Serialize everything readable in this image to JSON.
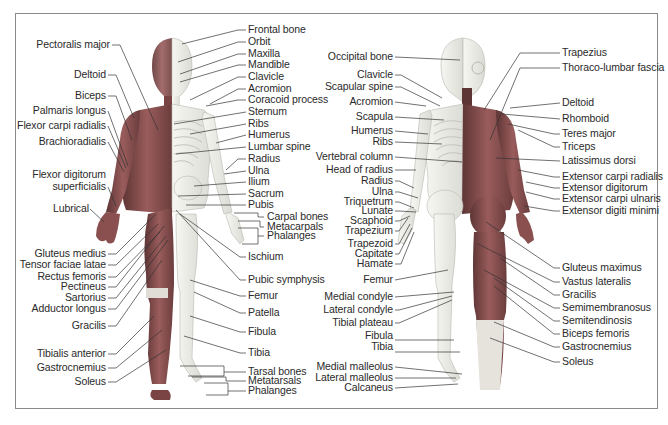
{
  "diagram": {
    "colors": {
      "muscle": "#8a5050",
      "muscle_dark": "#5e3535",
      "bone": "#eeeeea",
      "bone_outline": "#b8b8b0",
      "line": "#333333",
      "frame": "#8a8a8a"
    },
    "front_view": {
      "left_labels": [
        {
          "text": "Pectoralis major",
          "x": 110,
          "y": 45
        },
        {
          "text": "Deltoid",
          "x": 106,
          "y": 75
        },
        {
          "text": "Biceps",
          "x": 106,
          "y": 96
        },
        {
          "text": "Palmaris longus",
          "x": 106,
          "y": 111
        },
        {
          "text": "Flexor carpi radialis",
          "x": 106,
          "y": 126
        },
        {
          "text": "Brachioradialis",
          "x": 106,
          "y": 142
        },
        {
          "text": "Flexor digitorum",
          "x": 106,
          "y": 175
        },
        {
          "text": "superficialis",
          "x": 106,
          "y": 187
        },
        {
          "text": "Lubrical",
          "x": 89,
          "y": 209
        },
        {
          "text": "Gluteus medius",
          "x": 106,
          "y": 254
        },
        {
          "text": "Tensor faciae latae",
          "x": 106,
          "y": 265
        },
        {
          "text": "Rectus femoris",
          "x": 106,
          "y": 277
        },
        {
          "text": "Pectineus",
          "x": 106,
          "y": 287
        },
        {
          "text": "Sartorius",
          "x": 106,
          "y": 298
        },
        {
          "text": "Adductor longus",
          "x": 106,
          "y": 309
        },
        {
          "text": "Gracilis",
          "x": 106,
          "y": 326
        },
        {
          "text": "Tibialis anterior",
          "x": 106,
          "y": 354
        },
        {
          "text": "Gastrocnemius",
          "x": 106,
          "y": 368
        },
        {
          "text": "Soleus",
          "x": 106,
          "y": 382
        }
      ],
      "right_labels": [
        {
          "text": "Frontal bone",
          "x": 248,
          "y": 30
        },
        {
          "text": "Orbit",
          "x": 248,
          "y": 42
        },
        {
          "text": "Maxilla",
          "x": 248,
          "y": 54
        },
        {
          "text": "Mandible",
          "x": 248,
          "y": 65
        },
        {
          "text": "Clavicle",
          "x": 248,
          "y": 77
        },
        {
          "text": "Acromion",
          "x": 248,
          "y": 89
        },
        {
          "text": "Coracoid process",
          "x": 248,
          "y": 100
        },
        {
          "text": "Sternum",
          "x": 248,
          "y": 112
        },
        {
          "text": "Ribs",
          "x": 248,
          "y": 124
        },
        {
          "text": "Humerus",
          "x": 248,
          "y": 135
        },
        {
          "text": "Lumbar spine",
          "x": 248,
          "y": 147
        },
        {
          "text": "Radius",
          "x": 248,
          "y": 159
        },
        {
          "text": "Ulna",
          "x": 248,
          "y": 171
        },
        {
          "text": "Ilium",
          "x": 248,
          "y": 182
        },
        {
          "text": "Sacrum",
          "x": 248,
          "y": 194
        },
        {
          "text": "Pubis",
          "x": 248,
          "y": 205
        },
        {
          "text": "Carpal bones",
          "x": 267,
          "y": 217
        },
        {
          "text": "Metacarpals",
          "x": 267,
          "y": 227
        },
        {
          "text": "Phalanges",
          "x": 267,
          "y": 236
        },
        {
          "text": "Ischium",
          "x": 248,
          "y": 257
        },
        {
          "text": "Pubic symphysis",
          "x": 248,
          "y": 280
        },
        {
          "text": "Femur",
          "x": 248,
          "y": 296
        },
        {
          "text": "Patella",
          "x": 248,
          "y": 313
        },
        {
          "text": "Fibula",
          "x": 248,
          "y": 332
        },
        {
          "text": "Tibia",
          "x": 248,
          "y": 353
        },
        {
          "text": "Tarsal bones",
          "x": 248,
          "y": 372
        },
        {
          "text": "Metatarsals",
          "x": 248,
          "y": 381
        },
        {
          "text": "Phalanges",
          "x": 248,
          "y": 391
        }
      ]
    },
    "back_view": {
      "left_labels": [
        {
          "text": "Occipital bone",
          "x": 393,
          "y": 57
        },
        {
          "text": "Clavicle",
          "x": 393,
          "y": 75
        },
        {
          "text": "Scapular spine",
          "x": 393,
          "y": 87
        },
        {
          "text": "Acromion",
          "x": 393,
          "y": 102
        },
        {
          "text": "Scapula",
          "x": 393,
          "y": 117
        },
        {
          "text": "Humerus",
          "x": 393,
          "y": 131
        },
        {
          "text": "Ribs",
          "x": 393,
          "y": 142
        },
        {
          "text": "Vertebral column",
          "x": 393,
          "y": 157
        },
        {
          "text": "Head of radius",
          "x": 393,
          "y": 170
        },
        {
          "text": "Radius",
          "x": 393,
          "y": 181
        },
        {
          "text": "Ulna",
          "x": 393,
          "y": 192
        },
        {
          "text": "Triquetrum",
          "x": 393,
          "y": 202
        },
        {
          "text": "Lunate",
          "x": 393,
          "y": 211
        },
        {
          "text": "Scaphoid",
          "x": 393,
          "y": 221
        },
        {
          "text": "Trapezium",
          "x": 393,
          "y": 231
        },
        {
          "text": "Trapezoid",
          "x": 393,
          "y": 244
        },
        {
          "text": "Capitate",
          "x": 393,
          "y": 254
        },
        {
          "text": "Hamate",
          "x": 393,
          "y": 264
        },
        {
          "text": "Femur",
          "x": 393,
          "y": 280
        },
        {
          "text": "Medial condyle",
          "x": 393,
          "y": 297
        },
        {
          "text": "Lateral condyle",
          "x": 393,
          "y": 310
        },
        {
          "text": "Tibial plateau",
          "x": 393,
          "y": 323
        },
        {
          "text": "Fibula",
          "x": 393,
          "y": 336
        },
        {
          "text": "Tibia",
          "x": 393,
          "y": 347
        },
        {
          "text": "Medial malleolus",
          "x": 393,
          "y": 367
        },
        {
          "text": "Lateral malleolus",
          "x": 393,
          "y": 378
        },
        {
          "text": "Calcaneus",
          "x": 393,
          "y": 388
        }
      ],
      "right_labels": [
        {
          "text": "Trapezius",
          "x": 562,
          "y": 53
        },
        {
          "text": "Thoraco-lumbar fascia",
          "x": 562,
          "y": 68
        },
        {
          "text": "Deltoid",
          "x": 562,
          "y": 103
        },
        {
          "text": "Rhomboid",
          "x": 562,
          "y": 119
        },
        {
          "text": "Teres major",
          "x": 562,
          "y": 134
        },
        {
          "text": "Triceps",
          "x": 562,
          "y": 147
        },
        {
          "text": "Latissimus dorsi",
          "x": 562,
          "y": 161
        },
        {
          "text": "Extensor carpi radialis",
          "x": 562,
          "y": 177
        },
        {
          "text": "Extensor digitorum",
          "x": 562,
          "y": 188
        },
        {
          "text": "Extensor carpi ulnaris",
          "x": 562,
          "y": 199
        },
        {
          "text": "Extensor digiti minimi",
          "x": 562,
          "y": 211
        },
        {
          "text": "Gluteus maximus",
          "x": 562,
          "y": 268
        },
        {
          "text": "Vastus lateralis",
          "x": 562,
          "y": 282
        },
        {
          "text": "Gracilis",
          "x": 562,
          "y": 295
        },
        {
          "text": "Semimembranosus",
          "x": 562,
          "y": 308
        },
        {
          "text": "Semitendinosis",
          "x": 562,
          "y": 321
        },
        {
          "text": "Biceps femoris",
          "x": 562,
          "y": 334
        },
        {
          "text": "Gastrocnemius",
          "x": 562,
          "y": 347
        },
        {
          "text": "Soleus",
          "x": 562,
          "y": 362
        }
      ]
    }
  }
}
